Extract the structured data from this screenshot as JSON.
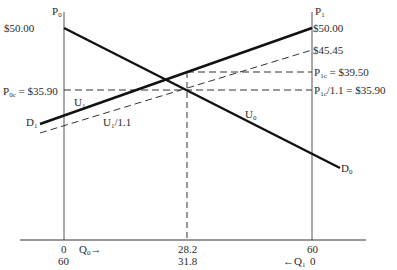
{
  "axes": {
    "left_axis_label": "P",
    "left_axis_sub": "0",
    "right_axis_label": "P",
    "right_axis_sub": "1",
    "left_top_price": "$50.00",
    "right_top_price": "$50.00",
    "right_mid_price": "$45.45",
    "p0c_label": "P",
    "p0c_sub": "0c",
    "p0c_value": " = $35.90",
    "p1c_label": "P",
    "p1c_sub": "1c",
    "p1c_value": " = $39.50",
    "p1c_div_label": "P",
    "p1c_div_sub": "1c",
    "p1c_div_value": "/1.1 = $35.90"
  },
  "curves": {
    "d0_label": "D",
    "d0_sub": "0",
    "d1_label": "D",
    "d1_sub": "1",
    "u0_label": "U",
    "u0_sub": "0",
    "u1_label": "U",
    "u1_sub": "1",
    "u1_div_label": "U",
    "u1_div_sub": "1",
    "u1_div_suffix": "/1.1"
  },
  "x_axis": {
    "left_top": "0",
    "left_bottom": "60",
    "q0_label": "Q",
    "q0_sub": "0",
    "q0_arrow": "→",
    "mid_top": "28.2",
    "mid_bottom": "31.8",
    "right_top": "60",
    "right_bottom": "0",
    "q1_arrow": "←",
    "q1_label": "Q",
    "q1_sub": "1"
  }
}
